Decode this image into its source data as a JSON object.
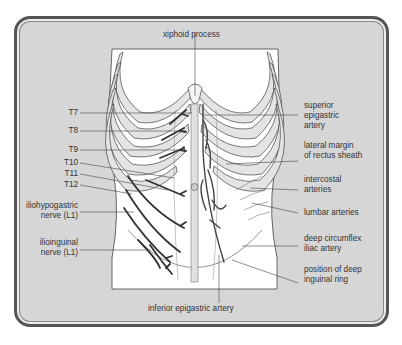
{
  "diagram": {
    "colors": {
      "background": "#d6d6d6",
      "frame": "#555555",
      "body": "#ffffff",
      "rib_fill": "#e2e2e2",
      "nerve": "#333333",
      "label_text": "#333333"
    },
    "top_label": "xiphoid process",
    "bottom_label": "inferior epigastric artery",
    "left_labels": [
      {
        "id": "t7",
        "text": "T7"
      },
      {
        "id": "t8",
        "text": "T8"
      },
      {
        "id": "t9",
        "text": "T9"
      },
      {
        "id": "t10",
        "text": "T10"
      },
      {
        "id": "t11",
        "text": "T11"
      },
      {
        "id": "t12",
        "text": "T12"
      },
      {
        "id": "iliohypogastric",
        "line1": "iliohypogastric",
        "line2": "nerve (L1)"
      },
      {
        "id": "ilioinguinal",
        "line1": "ilioinguinal",
        "line2": "nerve (L1)"
      }
    ],
    "right_labels": [
      {
        "id": "superior-epigastric",
        "line1": "superior",
        "line2": "epigastric",
        "line3": "artery"
      },
      {
        "id": "lateral-margin",
        "line1": "lateral margin",
        "line2": "of rectus sheath"
      },
      {
        "id": "intercostal",
        "line1": "intercostal",
        "line2": "arteries"
      },
      {
        "id": "lumbar",
        "line1": "lumbar arteries"
      },
      {
        "id": "deep-circumflex",
        "line1": "deep circumflex",
        "line2": "iliac artery"
      },
      {
        "id": "deep-inguinal-ring",
        "line1": "position of deep",
        "line2": "inguinal ring"
      }
    ]
  }
}
